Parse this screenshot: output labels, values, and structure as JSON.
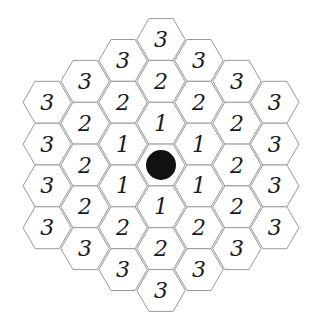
{
  "board": {
    "shape": "hexagonal-grid",
    "radius": 3,
    "center": {
      "x": 161,
      "y": 165
    },
    "hex_size": 23,
    "colors": {
      "cell_fill": "#ffffff",
      "cell_border": "#9a9a9a",
      "text": "#1a1a1a",
      "center_marker": "#111111"
    },
    "center_marker": "filled-black-circle",
    "cells": [
      {
        "q": 0,
        "r": -3,
        "label": "3"
      },
      {
        "q": -1,
        "r": -2,
        "label": "3"
      },
      {
        "q": 1,
        "r": -3,
        "label": "3"
      },
      {
        "q": -2,
        "r": -1,
        "label": "3"
      },
      {
        "q": 0,
        "r": -2,
        "label": "2"
      },
      {
        "q": 2,
        "r": -3,
        "label": "3"
      },
      {
        "q": -3,
        "r": 0,
        "label": "3"
      },
      {
        "q": -1,
        "r": -1,
        "label": "2"
      },
      {
        "q": 1,
        "r": -2,
        "label": "2"
      },
      {
        "q": 3,
        "r": -3,
        "label": "3"
      },
      {
        "q": -2,
        "r": 0,
        "label": "2"
      },
      {
        "q": 0,
        "r": -1,
        "label": "1"
      },
      {
        "q": 2,
        "r": -2,
        "label": "2"
      },
      {
        "q": -3,
        "r": 1,
        "label": "3"
      },
      {
        "q": -1,
        "r": 0,
        "label": "1"
      },
      {
        "q": 1,
        "r": -1,
        "label": "1"
      },
      {
        "q": 3,
        "r": -2,
        "label": "3"
      },
      {
        "q": -2,
        "r": 1,
        "label": "2"
      },
      {
        "q": 0,
        "r": 0,
        "label": ""
      },
      {
        "q": 2,
        "r": -1,
        "label": "2"
      },
      {
        "q": -3,
        "r": 2,
        "label": "3"
      },
      {
        "q": -1,
        "r": 1,
        "label": "1"
      },
      {
        "q": 1,
        "r": 0,
        "label": "1"
      },
      {
        "q": 3,
        "r": -1,
        "label": "3"
      },
      {
        "q": -2,
        "r": 2,
        "label": "2"
      },
      {
        "q": 0,
        "r": 1,
        "label": "1"
      },
      {
        "q": 2,
        "r": 0,
        "label": "2"
      },
      {
        "q": -3,
        "r": 3,
        "label": "3"
      },
      {
        "q": -1,
        "r": 2,
        "label": "2"
      },
      {
        "q": 1,
        "r": 1,
        "label": "2"
      },
      {
        "q": 3,
        "r": 0,
        "label": "3"
      },
      {
        "q": -2,
        "r": 3,
        "label": "3"
      },
      {
        "q": 0,
        "r": 2,
        "label": "2"
      },
      {
        "q": 2,
        "r": 1,
        "label": "3"
      },
      {
        "q": -1,
        "r": 3,
        "label": "3"
      },
      {
        "q": 1,
        "r": 2,
        "label": "3"
      },
      {
        "q": 0,
        "r": 3,
        "label": "3"
      }
    ]
  }
}
